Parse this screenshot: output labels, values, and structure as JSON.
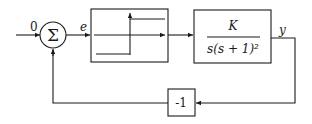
{
  "diagram": {
    "input_label": "0",
    "summing_symbol": "Σ",
    "error_label": "e",
    "relay_block": {
      "type": "relay-nonlinearity"
    },
    "plant_block": {
      "numerator": "K",
      "denominator": "s(s + 1)²"
    },
    "output_label": "y",
    "feedback_block": {
      "label": "-1"
    },
    "colors": {
      "line": "#1a1a1a",
      "background": "#ffffff"
    }
  }
}
